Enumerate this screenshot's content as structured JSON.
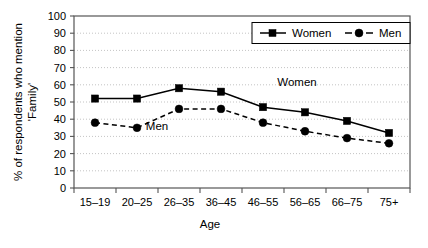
{
  "chart_data": {
    "type": "line",
    "title": "",
    "subtitle": "",
    "xlabel": "Age",
    "ylabel": "% of respondents who mention 'Family'",
    "ylabel_line1": "% of respondents who mention",
    "ylabel_line2": "'Family'",
    "categories": [
      "15–19",
      "20–25",
      "26–35",
      "36–45",
      "46–55",
      "56–65",
      "66–75",
      "75+"
    ],
    "ylim": [
      0,
      100
    ],
    "ytick_labels": [
      "0",
      "10",
      "20",
      "30",
      "40",
      "50",
      "60",
      "70",
      "80",
      "90",
      "100"
    ],
    "ytick_values": [
      0,
      10,
      20,
      30,
      40,
      50,
      60,
      70,
      80,
      90,
      100
    ],
    "grid": true,
    "grid_axis": "y",
    "legend_position": "top-right",
    "series": [
      {
        "name": "Women",
        "marker": "square",
        "line_style": "solid",
        "color": "#000000",
        "values": [
          52,
          52,
          58,
          56,
          47,
          44,
          39,
          32
        ]
      },
      {
        "name": "Men",
        "marker": "circle",
        "line_style": "dashed",
        "color": "#000000",
        "values": [
          38,
          35,
          46,
          46,
          38,
          33,
          29,
          26
        ]
      }
    ],
    "annotations": [
      {
        "text": "Women",
        "series": "Women"
      },
      {
        "text": "Men",
        "series": "Men"
      }
    ]
  },
  "legend": {
    "entries": [
      {
        "label": "Women"
      },
      {
        "label": "Men"
      }
    ]
  }
}
